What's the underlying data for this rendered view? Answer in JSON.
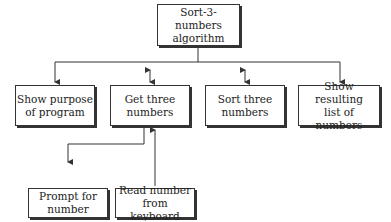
{
  "diagram": {
    "type": "structure-chart",
    "root": {
      "label": "Sort-3-numbers\nalgorithm"
    },
    "level2": [
      {
        "label": "Show purpose\nof program",
        "arrow": "down"
      },
      {
        "label": "Get three\nnumbers",
        "arrow": "bidirectional"
      },
      {
        "label": "Sort three\nnumbers",
        "arrow": "bidirectional"
      },
      {
        "label": "Show resulting\nlist of numbers",
        "arrow": "down"
      }
    ],
    "level3": [
      {
        "label": "Prompt for\nnumber",
        "parent": "Get three numbers",
        "arrow": "down"
      },
      {
        "label": "Read number\nfrom keyboard",
        "parent": "Get three numbers",
        "arrow": "up"
      }
    ],
    "colors": {
      "line": "#333333",
      "background": "#ffffff"
    }
  }
}
